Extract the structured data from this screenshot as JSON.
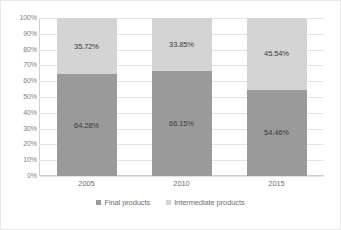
{
  "chart_data": {
    "type": "bar",
    "subtype": "100% stacked column",
    "title": "",
    "xlabel": "",
    "ylabel": "",
    "categories": [
      "2005",
      "2010",
      "2015"
    ],
    "series": [
      {
        "name": "Final products",
        "color": "#9a9a9a",
        "values": [
          64.28,
          66.15,
          54.46
        ],
        "labels": [
          "64.28%",
          "66.15%",
          "54.46%"
        ]
      },
      {
        "name": "Intermediate products",
        "color": "#d4d4d4",
        "values": [
          35.72,
          33.85,
          45.54
        ],
        "labels": [
          "35.72%",
          "33.85%",
          "45.54%"
        ]
      }
    ],
    "ylim": [
      0,
      100
    ],
    "yticks": [
      0,
      10,
      20,
      30,
      40,
      50,
      60,
      70,
      80,
      90,
      100
    ],
    "ytick_labels": [
      "0%",
      "10%",
      "20%",
      "30%",
      "40%",
      "50%",
      "60%",
      "70%",
      "80%",
      "90%",
      "100%"
    ],
    "grid": true,
    "legend_position": "bottom",
    "stack_order_bottom_to_top": [
      "Final products",
      "Intermediate products"
    ]
  },
  "legend": {
    "items": [
      {
        "label": "Final products",
        "color": "#9a9a9a",
        "marker": "square-marker"
      },
      {
        "label": "Intermediate products",
        "color": "#d4d4d4",
        "marker": "square-marker"
      }
    ]
  }
}
